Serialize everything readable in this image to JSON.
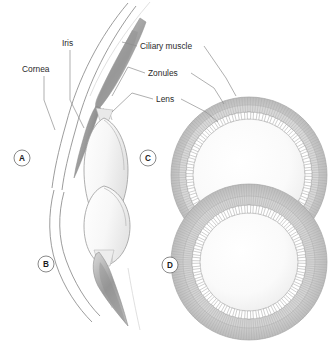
{
  "figure": {
    "background_color": "#ffffff",
    "width": 333,
    "height": 342
  },
  "labels": [
    {
      "id": "cornea",
      "text": "Cornea",
      "x": 22,
      "y": 72,
      "anchor": "start"
    },
    {
      "id": "iris",
      "text": "Iris",
      "x": 62,
      "y": 46,
      "anchor": "start"
    },
    {
      "id": "ciliary-muscle",
      "text": "Ciliary muscle",
      "x": 140,
      "y": 49,
      "anchor": "start"
    },
    {
      "id": "zonules",
      "text": "Zonules",
      "x": 148,
      "y": 76,
      "anchor": "start"
    },
    {
      "id": "lens",
      "text": "Lens",
      "x": 156,
      "y": 102,
      "anchor": "start"
    }
  ],
  "panels": [
    {
      "id": "A",
      "letter": "A",
      "cx": 22,
      "cy": 158,
      "r": 8,
      "description": "Sagittal section, unaccommodated eye: flattened lens, relaxed ciliary muscle, taut zonules"
    },
    {
      "id": "B",
      "letter": "B",
      "cx": 46,
      "cy": 264,
      "r": 8,
      "description": "Sagittal section, accommodated eye: rounded lens, contracted ciliary muscle, slack zonules"
    },
    {
      "id": "C",
      "letter": "C",
      "cx": 148,
      "cy": 158,
      "r": 8,
      "description": "Frontal view, unaccommodated: wide ciliary ring with stretched zonule fibers, large lens aperture"
    },
    {
      "id": "D",
      "letter": "D",
      "cx": 170,
      "cy": 265,
      "r": 8,
      "description": "Frontal view, accommodated: narrowed ciliary ring, thicker ciliary body, smaller lens aperture"
    }
  ],
  "colors": {
    "stroke_dark": "#8a8a8a",
    "stroke_mid": "#9a9a9a",
    "stroke_light": "#bdbdbd",
    "stroke_faint": "#d8d8d8",
    "label_text": "#2b2b2b",
    "leader_line": "#8e8e8e",
    "tissue_fill": "#c9c9c9",
    "lens_fill": "#f2f2f2",
    "background": "#ffffff"
  },
  "structures": {
    "cornea": "double curved line at left of panels A and B",
    "iris": "dark wedge anterior to the lens",
    "ciliary_muscle": "shaded triangular mass at the lens equator",
    "zonules": "fine fibers linking ciliary body to lens equator",
    "lens": "ovoid body, flattened in A/C and rounded in B/D"
  }
}
